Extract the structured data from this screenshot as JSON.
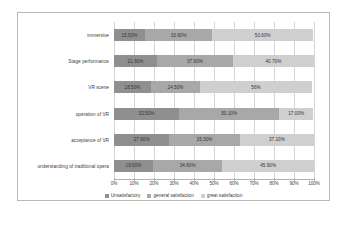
{
  "chart_data": {
    "type": "bar",
    "orientation": "horizontal",
    "stacked": true,
    "normalized_percent": true,
    "title": "",
    "xlabel": "",
    "ylabel": "",
    "xlim": [
      0,
      100
    ],
    "grid": true,
    "legend_position": "bottom",
    "categories": [
      "immersive",
      "Stage performance",
      "VR scene",
      "operation of VR",
      "acceptance of VR",
      "understanding of traditional opera"
    ],
    "tick_labels": [
      "0%",
      "10%",
      "20%",
      "30%",
      "40%",
      "50%",
      "60%",
      "70%",
      "80%",
      "90%",
      "100%"
    ],
    "tick_values": [
      0,
      10,
      20,
      30,
      40,
      50,
      60,
      70,
      80,
      90,
      100
    ],
    "series": [
      {
        "name": "Unsatisfactory",
        "color": "#8f8f8f",
        "values": [
          15.5,
          21.6,
          18.5,
          32.5,
          27.6,
          19.5
        ],
        "labels": [
          "15.50%",
          "21.60%",
          "18.50%",
          "32.50%",
          "27.60%",
          "19.50%"
        ]
      },
      {
        "name": "general satisfaction",
        "color": "#a8a8a8",
        "values": [
          33.6,
          37.9,
          24.5,
          50.1,
          35.3,
          34.6
        ],
        "labels": [
          "33.60%",
          "37.90%",
          "24.50%",
          "50.10%",
          "35.30%",
          "34.60%"
        ]
      },
      {
        "name": "great satisfaction",
        "color": "#cfcfcf",
        "values": [
          50.6,
          40.7,
          56.0,
          17.0,
          37.1,
          45.9
        ],
        "labels": [
          "50.60%",
          "40.70%",
          "56%",
          "17.00%",
          "37.10%",
          "45.90%"
        ]
      }
    ]
  }
}
